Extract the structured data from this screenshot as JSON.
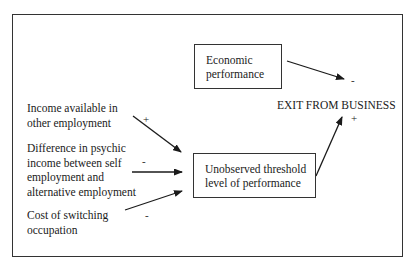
{
  "diagram": {
    "outcome": {
      "label": "EXIT FROM BUSINESS"
    },
    "boxes": {
      "economic_performance": {
        "lines": [
          "Economic",
          "performance"
        ]
      },
      "threshold": {
        "lines": [
          "Unobserved threshold",
          "level of performance"
        ]
      }
    },
    "factors": [
      {
        "id": "income",
        "lines": [
          "Income available in",
          "other employment"
        ],
        "sign": "+"
      },
      {
        "id": "psychic",
        "lines": [
          "Difference in psychic",
          "income between self",
          "employment and",
          "alternative employment"
        ],
        "sign": "-"
      },
      {
        "id": "cost",
        "lines": [
          "Cost of switching",
          "occupation"
        ],
        "sign": "-"
      }
    ],
    "edges": [
      {
        "from": "economic_performance",
        "to": "outcome",
        "sign": "-"
      },
      {
        "from": "threshold",
        "to": "outcome",
        "sign": "+"
      },
      {
        "from": "income",
        "to": "threshold",
        "sign": "+"
      },
      {
        "from": "psychic",
        "to": "threshold",
        "sign": "-"
      },
      {
        "from": "cost",
        "to": "threshold",
        "sign": "-"
      }
    ],
    "colors": {
      "line": "#1a1a1a",
      "background": "#ffffff"
    }
  }
}
